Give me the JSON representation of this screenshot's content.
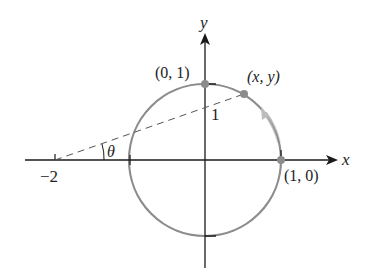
{
  "diagram": {
    "type": "unit-circle-parametrization",
    "colors": {
      "axis": "#1a1a1a",
      "circle": "#8c8c8c",
      "point": "#8c8c8c",
      "dashed": "#555555",
      "arrow": "#c8c8c8",
      "text": "#222222"
    },
    "axes": {
      "x_label": "x",
      "y_label": "y"
    },
    "labels": {
      "top_point": "(0, 1)",
      "moving_point": "(x, y)",
      "right_point": "(1, 0)",
      "neg_two": "−2",
      "one": "1",
      "theta": "θ"
    },
    "points": [
      {
        "name": "top",
        "coords": [
          0,
          1
        ]
      },
      {
        "name": "moving",
        "coords": [
          "x",
          "y"
        ]
      },
      {
        "name": "right",
        "coords": [
          1,
          0
        ]
      }
    ],
    "dashed_line": {
      "from": [
        -2,
        0
      ],
      "to": [
        "x",
        "y"
      ]
    },
    "angle": "θ"
  }
}
